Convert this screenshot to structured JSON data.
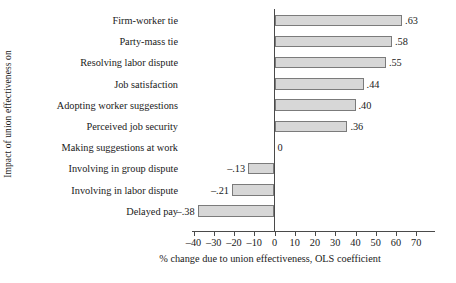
{
  "chart_data": {
    "type": "bar",
    "orientation": "horizontal",
    "title": "",
    "ylabel": "Impact of union effectiveness on",
    "xlabel": "% change due to union effectiveness, OLS coefficient",
    "xlim": [
      -45,
      75
    ],
    "xticks": [
      -40,
      -30,
      -20,
      -10,
      0,
      10,
      20,
      30,
      40,
      50,
      60,
      70
    ],
    "xtick_labels": [
      "–40",
      "–30",
      "–20",
      "–10",
      "0",
      "10",
      "20",
      "30",
      "40",
      "50",
      "60",
      "70"
    ],
    "grid": false,
    "legend": null,
    "categories": [
      "Firm-worker tie",
      "Party-mass tie",
      "Resolving labor dispute",
      "Job satisfaction",
      "Adopting worker suggestions",
      "Perceived job security",
      "Making suggestions at work",
      "Involving in group dispute",
      "Involving in labor dispute",
      "Delayed pay"
    ],
    "values": [
      63,
      58,
      55,
      44,
      40,
      36,
      0,
      -13,
      -21,
      -38
    ],
    "value_labels": [
      ".63",
      ".58",
      ".55",
      ".44",
      ".40",
      ".36",
      "0",
      "–.13",
      "–.21",
      "–.38"
    ],
    "bar_fill": "#d7d7d7",
    "bar_stroke": "#7b7b7b",
    "axis_color": "#4a4a4a"
  }
}
